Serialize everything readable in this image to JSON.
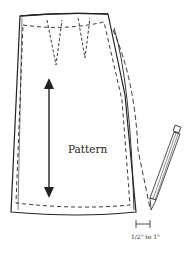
{
  "diagram": {
    "pattern_label": "Pattern",
    "measurement_label": "1/2\" to 1\"",
    "elements": [
      "skirt-pattern-piece",
      "darts",
      "grainline-arrow",
      "seam-allowance",
      "pencil",
      "added-width-indicator"
    ],
    "colors": {
      "line": "#222222",
      "background": "#ffffff"
    }
  }
}
